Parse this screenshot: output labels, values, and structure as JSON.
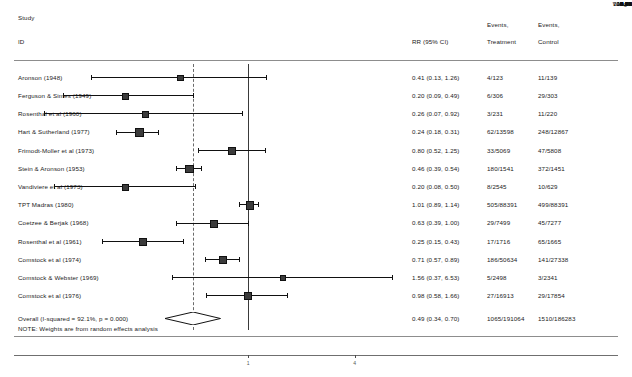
{
  "header": {
    "col_study_line1": "Study",
    "col_study_line2": "ID",
    "col_effect": "RR (95% CI)",
    "col_events_treatment_line1": "Events,",
    "col_events_treatment_line2": "Treatment",
    "col_events_control_line1": "Events,",
    "col_events_control_line2": "Control",
    "col_weight_line1": "%",
    "col_weight_line2": "Weight"
  },
  "note": "NOTE: Weights are from random effects analysis",
  "axis": {
    "ticks": [
      {
        "label": "1",
        "value": 1
      },
      {
        "label": "4",
        "value": 4
      }
    ]
  },
  "chart_data": {
    "type": "forest",
    "title": "",
    "xlabel": "",
    "ylabel": "",
    "effect_measure": "RR (95% CI)",
    "scale": "log",
    "null_value": 1,
    "pooled_reference_line": 0.49,
    "heterogeneity": "I-squared = 92.1%, p = 0.000",
    "model": "random effects",
    "xlim": [
      0.05,
      8
    ],
    "rows": [
      {
        "study": "Aronson (1948)",
        "rr": 0.41,
        "lcl": 0.13,
        "ucl": 1.26,
        "effect_text": "0.41 (0.13, 1.26)",
        "events_treatment": "4/123",
        "events_control": "11/139",
        "weight": "5.04"
      },
      {
        "study": "Ferguson & Simes (1949)",
        "rr": 0.2,
        "lcl": 0.09,
        "ucl": 0.49,
        "effect_text": "0.20 (0.09, 0.49)",
        "events_treatment": "6/306",
        "events_control": "29/303",
        "weight": "6.35"
      },
      {
        "study": "Rosenthal et al (1960)",
        "rr": 0.26,
        "lcl": 0.07,
        "ucl": 0.92,
        "effect_text": "0.26 (0.07, 0.92)",
        "events_treatment": "3/231",
        "events_control": "11/220",
        "weight": "4.42"
      },
      {
        "study": "Hart & Sutherland (1977)",
        "rr": 0.24,
        "lcl": 0.18,
        "ucl": 0.31,
        "effect_text": "0.24 (0.18, 0.31)",
        "events_treatment": "62/13598",
        "events_control": "248/12867",
        "weight": "9.71"
      },
      {
        "study": "Frimodt-Moller et al (1973)",
        "rr": 0.8,
        "lcl": 0.52,
        "ucl": 1.25,
        "effect_text": "0.80 (0.52, 1.25)",
        "events_treatment": "33/5069",
        "events_control": "47/5808",
        "weight": "8.87"
      },
      {
        "study": "Stein & Aronson (1953)",
        "rr": 0.46,
        "lcl": 0.39,
        "ucl": 0.54,
        "effect_text": "0.46 (0.39, 0.54)",
        "events_treatment": "180/1541",
        "events_control": "372/1451",
        "weight": "10.12"
      },
      {
        "study": "Vandiviere et al (1973)",
        "rr": 0.2,
        "lcl": 0.08,
        "ucl": 0.5,
        "effect_text": "0.20 (0.08, 0.50)",
        "events_treatment": "8/2545",
        "events_control": "10/629",
        "weight": "6.01"
      },
      {
        "study": "TPT Madras (1980)",
        "rr": 1.01,
        "lcl": 0.89,
        "ucl": 1.14,
        "effect_text": "1.01 (0.89, 1.14)",
        "events_treatment": "505/88391",
        "events_control": "499/88391",
        "weight": "10.21"
      },
      {
        "study": "Coetzee & Berjak (1968)",
        "rr": 0.63,
        "lcl": 0.39,
        "ucl": 1.0,
        "effect_text": "0.63 (0.39, 1.00)",
        "events_treatment": "29/7499",
        "events_control": "45/7277",
        "weight": "8.75"
      },
      {
        "study": "Rosenthal et al (1961)",
        "rr": 0.25,
        "lcl": 0.15,
        "ucl": 0.43,
        "effect_text": "0.25 (0.15, 0.43)",
        "events_treatment": "17/1716",
        "events_control": "65/1665",
        "weight": "8.37"
      },
      {
        "study": "Comstock et al (1974)",
        "rr": 0.71,
        "lcl": 0.57,
        "ucl": 0.89,
        "effect_text": "0.71 (0.57, 0.89)",
        "events_treatment": "186/50634",
        "events_control": "141/27338",
        "weight": "9.94"
      },
      {
        "study": "Comstock & Webster (1969)",
        "rr": 1.56,
        "lcl": 0.37,
        "ucl": 6.53,
        "effect_text": "1.56 (0.37, 6.53)",
        "events_treatment": "5/2498",
        "events_control": "3/2341",
        "weight": "3.80"
      },
      {
        "study": "Comstock et al (1976)",
        "rr": 0.98,
        "lcl": 0.58,
        "ucl": 1.66,
        "effect_text": "0.98 (0.58, 1.66)",
        "events_treatment": "27/16913",
        "events_control": "29/17854",
        "weight": "8.40"
      }
    ],
    "overall": {
      "study": "Overall  (I-squared = 92.1%, p = 0.000)",
      "rr": 0.49,
      "lcl": 0.34,
      "ucl": 0.7,
      "effect_text": "0.49 (0.34, 0.70)",
      "events_treatment": "1065/191064",
      "events_control": "1510/186283",
      "weight": "100.00"
    }
  }
}
